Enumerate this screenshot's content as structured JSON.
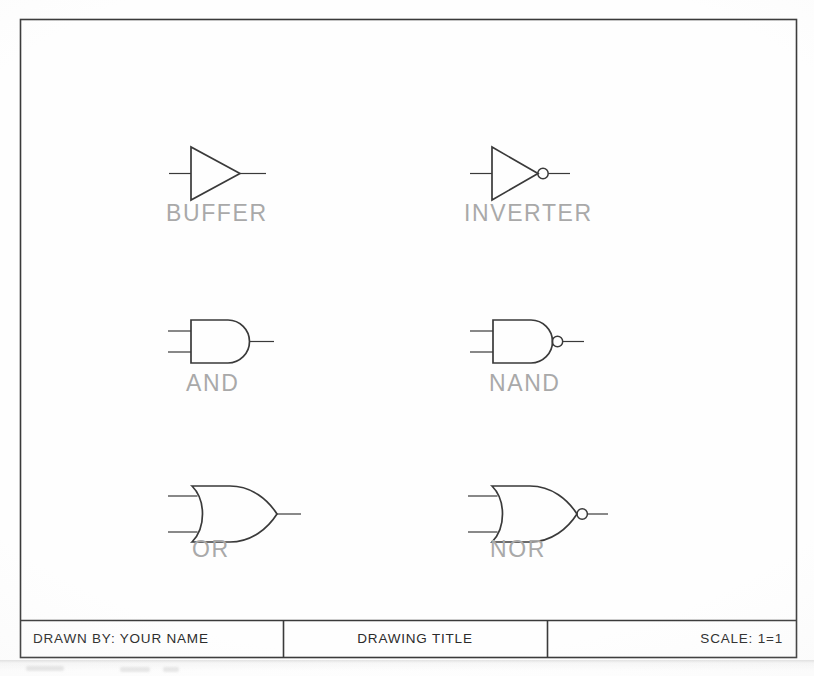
{
  "sheet": {
    "background_color": "#fefefe",
    "border_color": "#3a3a3a",
    "line_color": "#3a3a3a",
    "label_color": "#a9a9a9",
    "title_text_color": "#2b2b2b"
  },
  "drawing": {
    "name": "logic-gate-symbols-sheet",
    "gates": [
      {
        "id": "buffer",
        "label": "BUFFER",
        "symbol": "triangle",
        "inputs": 1,
        "inverted_output": false,
        "label_x": 166,
        "label_y": 202
      },
      {
        "id": "inverter",
        "label": "INVERTER",
        "symbol": "triangle",
        "inputs": 1,
        "inverted_output": true,
        "label_x": 464,
        "label_y": 202
      },
      {
        "id": "and",
        "label": "AND",
        "symbol": "d-shape",
        "inputs": 2,
        "inverted_output": false,
        "label_x": 186,
        "label_y": 372
      },
      {
        "id": "nand",
        "label": "NAND",
        "symbol": "d-shape",
        "inputs": 2,
        "inverted_output": true,
        "label_x": 489,
        "label_y": 372
      },
      {
        "id": "or",
        "label": "OR",
        "symbol": "shield-shape",
        "inputs": 2,
        "inverted_output": false,
        "label_x": 192,
        "label_y": 538
      },
      {
        "id": "nor",
        "label": "NOR",
        "symbol": "shield-shape",
        "inputs": 2,
        "inverted_output": true,
        "label_x": 490,
        "label_y": 538
      }
    ]
  },
  "title_block": {
    "name": "title-block",
    "cells": [
      {
        "id": "drawn-by",
        "text": "DRAWN BY: YOUR NAME",
        "align": "left"
      },
      {
        "id": "drawing-title",
        "text": "DRAWING TITLE",
        "align": "center"
      },
      {
        "id": "scale",
        "text": "SCALE:  1=1",
        "align": "right"
      }
    ]
  }
}
